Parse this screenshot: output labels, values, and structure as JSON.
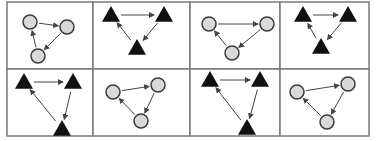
{
  "diagram": {
    "layout": {
      "rows": 2,
      "cols": 4
    },
    "colors": {
      "background": "#ffffff",
      "grid": "#7a7a7a",
      "circle_fill": "#d9d9d9",
      "circle_stroke": "#3a3a3a",
      "triangle_fill": "#111111",
      "arrow": "#444444"
    },
    "grid": {
      "x": [
        7,
        93,
        190,
        280,
        369
      ],
      "y": [
        2,
        69,
        136
      ]
    },
    "cells": [
      {
        "id": "cell-1",
        "shape": "circle",
        "nodes": [
          [
            30,
            22
          ],
          [
            67,
            27
          ],
          [
            38,
            56
          ]
        ],
        "edges": [
          [
            0,
            1
          ],
          [
            1,
            2
          ],
          [
            2,
            0
          ]
        ]
      },
      {
        "id": "cell-2",
        "shape": "triangle",
        "nodes": [
          [
            111,
            15
          ],
          [
            164,
            15
          ],
          [
            137,
            48
          ]
        ],
        "edges": [
          [
            0,
            1
          ],
          [
            1,
            2
          ],
          [
            2,
            0
          ]
        ]
      },
      {
        "id": "cell-3",
        "shape": "circle",
        "nodes": [
          [
            209,
            24
          ],
          [
            267,
            24
          ],
          [
            232,
            53
          ]
        ],
        "edges": [
          [
            0,
            1
          ],
          [
            1,
            2
          ],
          [
            2,
            0
          ]
        ]
      },
      {
        "id": "cell-4",
        "shape": "triangle",
        "nodes": [
          [
            303,
            15
          ],
          [
            348,
            15
          ],
          [
            321,
            47
          ]
        ],
        "edges": [
          [
            0,
            1
          ],
          [
            1,
            2
          ],
          [
            2,
            0
          ]
        ]
      },
      {
        "id": "cell-5",
        "shape": "triangle",
        "nodes": [
          [
            24,
            82
          ],
          [
            73,
            82
          ],
          [
            62,
            129
          ]
        ],
        "edges": [
          [
            0,
            1
          ],
          [
            1,
            2
          ],
          [
            2,
            0
          ]
        ]
      },
      {
        "id": "cell-6",
        "shape": "circle",
        "nodes": [
          [
            113,
            92
          ],
          [
            158,
            85
          ],
          [
            141,
            121
          ]
        ],
        "edges": [
          [
            0,
            1
          ],
          [
            1,
            2
          ],
          [
            2,
            0
          ]
        ]
      },
      {
        "id": "cell-7",
        "shape": "triangle",
        "nodes": [
          [
            210,
            80
          ],
          [
            260,
            80
          ],
          [
            247,
            128
          ]
        ],
        "edges": [
          [
            0,
            1
          ],
          [
            1,
            2
          ],
          [
            2,
            0
          ]
        ]
      },
      {
        "id": "cell-8",
        "shape": "circle",
        "nodes": [
          [
            297,
            92
          ],
          [
            348,
            84
          ],
          [
            327,
            122
          ]
        ],
        "edges": [
          [
            0,
            1
          ],
          [
            1,
            2
          ],
          [
            2,
            0
          ]
        ]
      }
    ]
  }
}
